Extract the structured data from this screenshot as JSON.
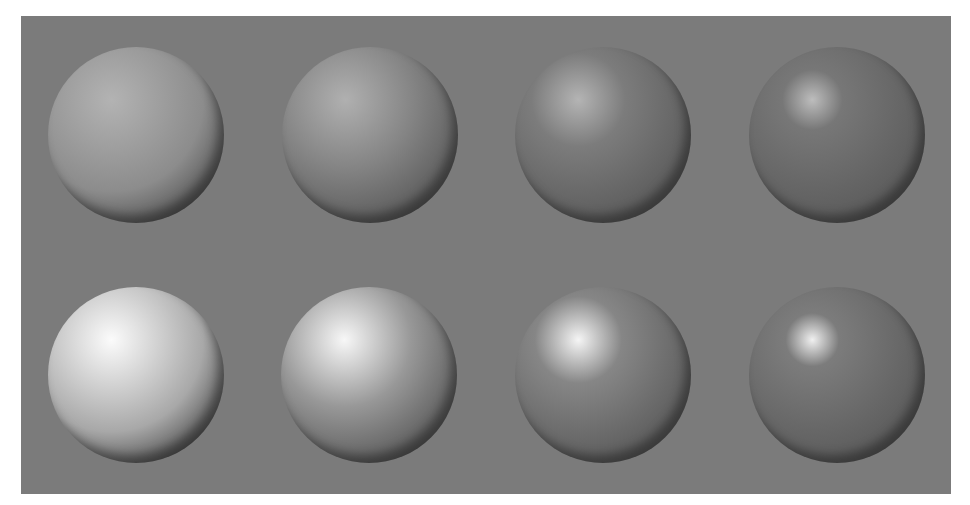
{
  "scene": {
    "description": "Grid of eight shaded spheres on a gray background illustrating increasing specular tightness (left to right) and diffuse brightness (top row dim, bottom row bright)",
    "background_color": "#7b7b7b",
    "rows": [
      {
        "name": "dim",
        "spheres": [
          {
            "cx": 136,
            "cy": 135,
            "r": 88,
            "highlight": "#b3b3b3",
            "mid": "#8c8c8c",
            "spread": 55
          },
          {
            "cx": 370,
            "cy": 135,
            "r": 88,
            "highlight": "#b0b0b0",
            "mid": "#838383",
            "spread": 42
          },
          {
            "cx": 603,
            "cy": 135,
            "r": 88,
            "highlight": "#b4b4b4",
            "mid": "#7c7c7c",
            "spread": 28
          },
          {
            "cx": 837,
            "cy": 135,
            "r": 88,
            "highlight": "#bdbdbd",
            "mid": "#777777",
            "spread": 18
          }
        ]
      },
      {
        "name": "bright",
        "spheres": [
          {
            "cx": 136,
            "cy": 375,
            "r": 88,
            "highlight": "#fbfbfb",
            "mid": "#a8a8a8",
            "spread": 55
          },
          {
            "cx": 369,
            "cy": 375,
            "r": 88,
            "highlight": "#f7f7f7",
            "mid": "#989898",
            "spread": 40
          },
          {
            "cx": 603,
            "cy": 375,
            "r": 88,
            "highlight": "#f5f5f5",
            "mid": "#868686",
            "spread": 26
          },
          {
            "cx": 837,
            "cy": 375,
            "r": 88,
            "highlight": "#f0f0f0",
            "mid": "#7c7c7c",
            "spread": 16
          }
        ]
      }
    ]
  }
}
